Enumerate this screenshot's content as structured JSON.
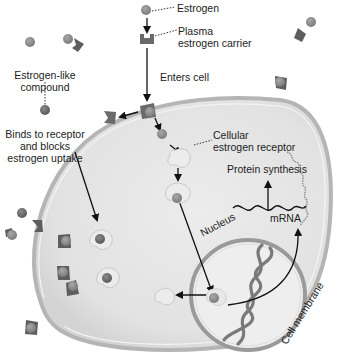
{
  "diagram": {
    "labels": {
      "estrogen": "Estrogen",
      "carrier_line1": "Plasma",
      "carrier_line2": "estrogen carrier",
      "enters_cell": "Enters cell",
      "estrogen_like_line1": "Estrogen-like",
      "estrogen_like_line2": "compound",
      "binds_line1": "Binds to receptor",
      "binds_line2": "and blocks",
      "binds_line3": "estrogen uptake",
      "cellular_line1": "Cellular",
      "cellular_line2": "estrogen receptor",
      "protein_synthesis": "Protein synthesis",
      "mrna": "mRNA",
      "nucleus": "Nucleus",
      "cell_membrane": "Cell membrane"
    },
    "colors": {
      "cell_fill": "#e4e4e4",
      "membrane": "#a8a8a8",
      "estrogen": "#8c8c8c",
      "carrier": "#6a6a6a",
      "receptor": "#ececec",
      "blocker": "#6b6b6b",
      "dna": "#7a7a7a",
      "arrow": "#111111"
    }
  }
}
